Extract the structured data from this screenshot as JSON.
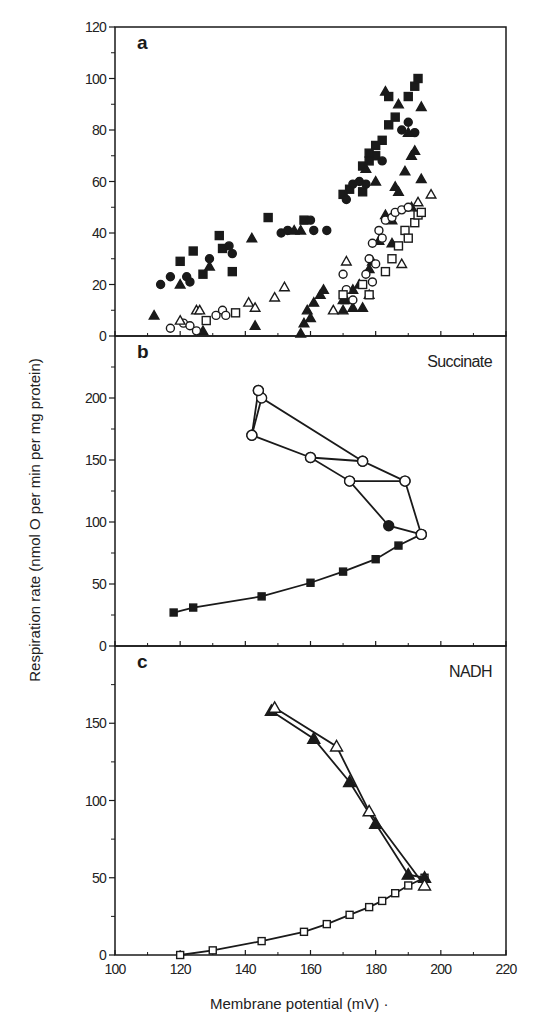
{
  "chart_data": {
    "type": "scatter",
    "layout": "three vertically stacked panels sharing x axis",
    "xlabel": "Membrane potential (mV)",
    "ylabel": "Respiration rate  (nmol O per min per mg protein)",
    "xlim": [
      100,
      220
    ],
    "xticks": [
      100,
      120,
      140,
      160,
      180,
      200,
      220
    ],
    "grid": false,
    "panels": [
      {
        "label": "a",
        "title": "",
        "ylim": [
          0,
          120
        ],
        "yticks": [
          0,
          20,
          40,
          60,
          80,
          100,
          120
        ],
        "type": "scatter",
        "series": [
          {
            "name": "filled squares",
            "marker": "square",
            "filled": true,
            "connected": false,
            "points": [
              [
                120,
                29
              ],
              [
                124,
                33
              ],
              [
                127,
                24
              ],
              [
                132,
                39
              ],
              [
                133,
                34
              ],
              [
                136,
                25
              ],
              [
                147,
                46
              ],
              [
                158,
                45
              ],
              [
                170,
                55
              ],
              [
                172,
                57
              ],
              [
                176,
                56
              ],
              [
                178,
                68
              ],
              [
                180,
                70
              ],
              [
                182,
                76
              ],
              [
                184,
                82
              ],
              [
                186,
                85
              ],
              [
                190,
                93
              ],
              [
                192,
                97
              ],
              [
                193,
                100
              ],
              [
                180,
                74
              ],
              [
                176,
                66
              ],
              [
                178,
                71
              ],
              [
                184,
                93
              ]
            ]
          },
          {
            "name": "filled circles",
            "marker": "circle",
            "filled": true,
            "connected": false,
            "points": [
              [
                114,
                20
              ],
              [
                117,
                23
              ],
              [
                122,
                23
              ],
              [
                123,
                21
              ],
              [
                129,
                30
              ],
              [
                136,
                32
              ],
              [
                135,
                35
              ],
              [
                151,
                40
              ],
              [
                153,
                41
              ],
              [
                160,
                45
              ],
              [
                161,
                41
              ],
              [
                165,
                41
              ],
              [
                171,
                53
              ],
              [
                173,
                59
              ],
              [
                175,
                60
              ],
              [
                177,
                59
              ],
              [
                182,
                68
              ],
              [
                188,
                80
              ],
              [
                190,
                83
              ],
              [
                192,
                79
              ]
            ]
          },
          {
            "name": "filled triangles",
            "marker": "triangle",
            "filled": true,
            "connected": false,
            "points": [
              [
                120,
                20
              ],
              [
                129,
                27
              ],
              [
                142,
                38
              ],
              [
                155,
                41
              ],
              [
                157,
                41
              ],
              [
                112,
                8
              ],
              [
                127,
                2
              ],
              [
                143,
                4
              ],
              [
                157,
                1
              ],
              [
                158,
                5
              ],
              [
                159,
                10
              ],
              [
                161,
                13
              ],
              [
                163,
                16
              ],
              [
                164,
                18
              ],
              [
                160,
                7
              ],
              [
                170,
                10
              ],
              [
                171,
                14
              ],
              [
                173,
                18
              ],
              [
                175,
                20
              ],
              [
                173,
                11
              ],
              [
                176,
                11
              ],
              [
                178,
                26
              ],
              [
                179,
                29
              ],
              [
                181,
                37
              ],
              [
                183,
                47
              ],
              [
                185,
                45
              ],
              [
                187,
                56
              ],
              [
                189,
                64
              ],
              [
                191,
                70
              ],
              [
                183,
                95
              ],
              [
                187,
                90
              ],
              [
                190,
                79
              ],
              [
                192,
                72
              ],
              [
                194,
                89
              ],
              [
                186,
                58
              ],
              [
                194,
                61
              ],
              [
                191,
                50
              ],
              [
                177,
                65
              ],
              [
                180,
                60
              ],
              [
                185,
                36
              ],
              [
                178,
                16
              ],
              [
                170,
                14
              ]
            ]
          },
          {
            "name": "open circles",
            "marker": "circle",
            "filled": false,
            "connected": false,
            "points": [
              [
                117,
                3
              ],
              [
                121,
                5
              ],
              [
                123,
                4
              ],
              [
                125,
                2
              ],
              [
                131,
                8
              ],
              [
                133,
                10
              ],
              [
                134,
                8
              ],
              [
                170,
                24
              ],
              [
                171,
                18
              ],
              [
                173,
                14
              ],
              [
                178,
                30
              ],
              [
                179,
                36
              ],
              [
                181,
                41
              ],
              [
                183,
                45
              ],
              [
                185,
                46
              ],
              [
                186,
                48
              ],
              [
                188,
                49
              ],
              [
                190,
                50
              ],
              [
                177,
                24
              ],
              [
                179,
                21
              ],
              [
                180,
                28
              ],
              [
                182,
                38
              ]
            ]
          },
          {
            "name": "open squares",
            "marker": "square",
            "filled": false,
            "connected": false,
            "points": [
              [
                128,
                6
              ],
              [
                137,
                9
              ],
              [
                170,
                16
              ],
              [
                176,
                20
              ],
              [
                178,
                16
              ],
              [
                183,
                25
              ],
              [
                185,
                30
              ],
              [
                187,
                35
              ],
              [
                189,
                41
              ],
              [
                190,
                38
              ],
              [
                192,
                44
              ],
              [
                193,
                47
              ],
              [
                194,
                48
              ]
            ]
          },
          {
            "name": "open triangles",
            "marker": "triangle",
            "filled": false,
            "connected": false,
            "points": [
              [
                120,
                6
              ],
              [
                125,
                10
              ],
              [
                126,
                10
              ],
              [
                141,
                13
              ],
              [
                143,
                11
              ],
              [
                149,
                15
              ],
              [
                152,
                19
              ],
              [
                167,
                10
              ],
              [
                171,
                29
              ],
              [
                188,
                28
              ],
              [
                193,
                52
              ],
              [
                197,
                55
              ]
            ]
          }
        ]
      },
      {
        "label": "b",
        "title": "Succinate",
        "ylim": [
          0,
          250
        ],
        "yticks": [
          0,
          50,
          100,
          150,
          200
        ],
        "type": "line",
        "series": [
          {
            "name": "filled squares (forward)",
            "marker": "square",
            "filled": true,
            "connected": true,
            "points": [
              [
                118,
                27
              ],
              [
                124,
                31
              ],
              [
                145,
                40
              ],
              [
                160,
                51
              ],
              [
                170,
                60
              ],
              [
                180,
                70
              ],
              [
                187,
                81
              ],
              [
                194,
                90
              ]
            ]
          },
          {
            "name": "filled circles",
            "marker": "circle",
            "filled": true,
            "connected": true,
            "points": [
              [
                194,
                90
              ],
              [
                184,
                97
              ],
              [
                172,
                133
              ],
              [
                160,
                152
              ],
              [
                142,
                170
              ],
              [
                144,
                206
              ]
            ]
          },
          {
            "name": "open circles",
            "marker": "circle",
            "filled": false,
            "connected": true,
            "points": [
              [
                194,
                90
              ],
              [
                189,
                133
              ],
              [
                172,
                133
              ]
            ]
          },
          {
            "name": "open circles upper",
            "marker": "circle",
            "filled": false,
            "connected": true,
            "points": [
              [
                160,
                152
              ],
              [
                176,
                149
              ],
              [
                189,
                133
              ]
            ]
          },
          {
            "name": "open circles top",
            "marker": "circle",
            "filled": false,
            "connected": true,
            "points": [
              [
                142,
                170
              ],
              [
                145,
                200
              ],
              [
                176,
                149
              ]
            ]
          },
          {
            "name": "open circle apex",
            "marker": "circle",
            "filled": false,
            "connected": false,
            "points": [
              [
                144,
                206
              ]
            ]
          }
        ]
      },
      {
        "label": "c",
        "title": "NADH",
        "ylim": [
          0,
          200
        ],
        "yticks": [
          0,
          50,
          100,
          150
        ],
        "type": "line",
        "series": [
          {
            "name": "open squares (forward)",
            "marker": "square",
            "filled": false,
            "connected": true,
            "points": [
              [
                120,
                0
              ],
              [
                130,
                3
              ],
              [
                145,
                9
              ],
              [
                158,
                15
              ],
              [
                165,
                20
              ],
              [
                172,
                26
              ],
              [
                178,
                31
              ],
              [
                182,
                35
              ],
              [
                186,
                40
              ],
              [
                190,
                45
              ],
              [
                195,
                50
              ]
            ]
          },
          {
            "name": "filled triangles",
            "marker": "triangle",
            "filled": true,
            "connected": true,
            "points": [
              [
                195,
                50
              ],
              [
                190,
                52
              ],
              [
                180,
                85
              ],
              [
                172,
                112
              ],
              [
                161,
                140
              ],
              [
                148,
                158
              ]
            ]
          },
          {
            "name": "open triangles",
            "marker": "triangle",
            "filled": false,
            "connected": true,
            "points": [
              [
                195,
                45
              ],
              [
                178,
                93
              ],
              [
                168,
                135
              ],
              [
                149,
                160
              ]
            ]
          }
        ]
      }
    ]
  },
  "figure": {
    "ylabel": "Respiration rate  (nmol O per min per mg protein)",
    "xlabel": "Membrane potential (mV) ·",
    "panel_labels": [
      "a",
      "b",
      "c"
    ],
    "panel_titles": [
      "",
      "Succinate",
      "NADH"
    ],
    "colors": {
      "ink": "#1a1a1a",
      "background": "#ffffff"
    }
  }
}
